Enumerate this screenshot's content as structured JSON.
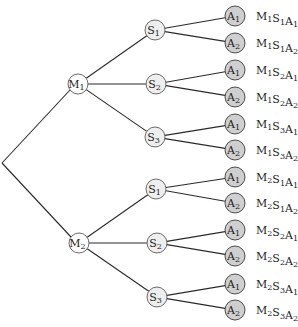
{
  "diagram": {
    "type": "tree",
    "title": "",
    "root": {
      "x": 2,
      "y": 163
    },
    "levels": {
      "M": [
        {
          "label": "M",
          "sub": "1",
          "x": 78,
          "y": 84
        },
        {
          "label": "M",
          "sub": "2",
          "x": 79,
          "y": 243
        }
      ],
      "S": [
        {
          "label": "S",
          "sub": "1",
          "parent": 0,
          "x": 155,
          "y": 30
        },
        {
          "label": "S",
          "sub": "2",
          "parent": 0,
          "x": 156,
          "y": 84
        },
        {
          "label": "S",
          "sub": "3",
          "parent": 0,
          "x": 155,
          "y": 137
        },
        {
          "label": "S",
          "sub": "1",
          "parent": 1,
          "x": 156,
          "y": 189
        },
        {
          "label": "S",
          "sub": "2",
          "parent": 1,
          "x": 157,
          "y": 243
        },
        {
          "label": "S",
          "sub": "3",
          "parent": 1,
          "x": 157,
          "y": 297
        }
      ],
      "A": [
        {
          "label": "A",
          "sub": "1",
          "parent": 0,
          "x": 235,
          "y": 16
        },
        {
          "label": "A",
          "sub": "2",
          "parent": 0,
          "x": 235,
          "y": 43
        },
        {
          "label": "A",
          "sub": "1",
          "parent": 1,
          "x": 235,
          "y": 70
        },
        {
          "label": "A",
          "sub": "2",
          "parent": 1,
          "x": 235,
          "y": 97
        },
        {
          "label": "A",
          "sub": "1",
          "parent": 2,
          "x": 235,
          "y": 124
        },
        {
          "label": "A",
          "sub": "2",
          "parent": 2,
          "x": 235,
          "y": 150
        },
        {
          "label": "A",
          "sub": "1",
          "parent": 3,
          "x": 235,
          "y": 177
        },
        {
          "label": "A",
          "sub": "2",
          "parent": 3,
          "x": 235,
          "y": 203
        },
        {
          "label": "A",
          "sub": "1",
          "parent": 4,
          "x": 235,
          "y": 230
        },
        {
          "label": "A",
          "sub": "2",
          "parent": 4,
          "x": 235,
          "y": 256
        },
        {
          "label": "A",
          "sub": "1",
          "parent": 5,
          "x": 235,
          "y": 284
        },
        {
          "label": "A",
          "sub": "2",
          "parent": 5,
          "x": 235,
          "y": 310
        }
      ]
    },
    "outcomes": [
      [
        [
          "M",
          "1"
        ],
        [
          "S",
          "1"
        ],
        [
          "A",
          "1"
        ]
      ],
      [
        [
          "M",
          "1"
        ],
        [
          "S",
          "1"
        ],
        [
          "A",
          "2"
        ]
      ],
      [
        [
          "M",
          "1"
        ],
        [
          "S",
          "2"
        ],
        [
          "A",
          "1"
        ]
      ],
      [
        [
          "M",
          "1"
        ],
        [
          "S",
          "2"
        ],
        [
          "A",
          "2"
        ]
      ],
      [
        [
          "M",
          "1"
        ],
        [
          "S",
          "3"
        ],
        [
          "A",
          "1"
        ]
      ],
      [
        [
          "M",
          "1"
        ],
        [
          "S",
          "3"
        ],
        [
          "A",
          "2"
        ]
      ],
      [
        [
          "M",
          "2"
        ],
        [
          "S",
          "1"
        ],
        [
          "A",
          "1"
        ]
      ],
      [
        [
          "M",
          "2"
        ],
        [
          "S",
          "1"
        ],
        [
          "A",
          "2"
        ]
      ],
      [
        [
          "M",
          "2"
        ],
        [
          "S",
          "2"
        ],
        [
          "A",
          "1"
        ]
      ],
      [
        [
          "M",
          "2"
        ],
        [
          "S",
          "2"
        ],
        [
          "A",
          "2"
        ]
      ],
      [
        [
          "M",
          "2"
        ],
        [
          "S",
          "3"
        ],
        [
          "A",
          "1"
        ]
      ],
      [
        [
          "M",
          "2"
        ],
        [
          "S",
          "3"
        ],
        [
          "A",
          "2"
        ]
      ]
    ],
    "outcome_labels": [
      "M1S1A1",
      "M1S1A2",
      "M1S2A1",
      "M1S2A2",
      "M1S3A1",
      "M1S3A2",
      "M2S1A1",
      "M2S1A2",
      "M2S2A1",
      "M2S2A2",
      "M2S3A1",
      "M2S3A2"
    ],
    "colors": {
      "edge": "#2a2a2a",
      "m_fill": "#ffffff",
      "s_fill": "#eeeeee",
      "a_fill": "#cfcfcf",
      "stroke": "#5a5a5a"
    }
  }
}
